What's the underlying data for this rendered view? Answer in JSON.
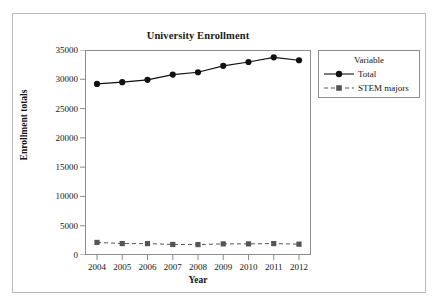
{
  "figure": {
    "title": "University Enrollment"
  },
  "axes": {
    "x_title": "Year",
    "y_title": "Enrollment totals"
  },
  "legend": {
    "title": "Variable",
    "entries": [
      {
        "label": "Total",
        "marker": "filled-circle-marker",
        "line": "solid",
        "color": "#111111"
      },
      {
        "label": "STEM majors",
        "marker": "filled-square-marker",
        "line": "dashed",
        "color": "#555555"
      }
    ]
  },
  "chart_data": {
    "type": "line",
    "title": "University Enrollment",
    "xlabel": "Year",
    "ylabel": "Enrollment totals",
    "x": [
      2004,
      2005,
      2006,
      2007,
      2008,
      2009,
      2010,
      2011,
      2012
    ],
    "categories": [
      "2004",
      "2005",
      "2006",
      "2007",
      "2008",
      "2009",
      "2010",
      "2011",
      "2012"
    ],
    "series": [
      {
        "name": "Total",
        "values": [
          29200,
          29500,
          29900,
          30800,
          31200,
          32300,
          32950,
          33750,
          33250
        ],
        "color": "#111111",
        "line": "solid",
        "marker": "circle"
      },
      {
        "name": "STEM majors",
        "values": [
          2150,
          1950,
          1950,
          1800,
          1780,
          1900,
          1900,
          1950,
          1850
        ],
        "color": "#555555",
        "line": "dashed",
        "marker": "square"
      }
    ],
    "ylim": [
      0,
      35000
    ],
    "yticks": [
      0,
      5000,
      10000,
      15000,
      20000,
      25000,
      30000,
      35000
    ],
    "ytick_labels": [
      "0",
      "5000",
      "10000",
      "15000",
      "20000",
      "25000",
      "30000",
      "35000"
    ],
    "xtick_labels": [
      "2004",
      "2005",
      "2006",
      "2007",
      "2008",
      "2009",
      "2010",
      "2011",
      "2012"
    ],
    "grid": false,
    "legend_position": "right"
  }
}
